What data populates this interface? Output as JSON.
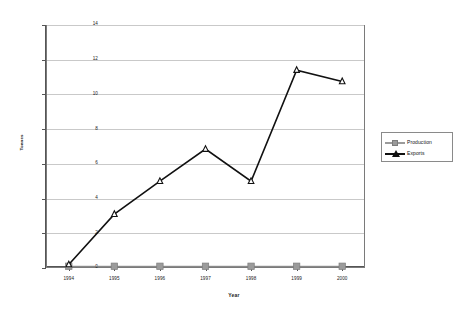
{
  "chart_data": {
    "type": "line",
    "title": "",
    "xlabel": "Year",
    "ylabel": "Tonnes",
    "categories": [
      "1994",
      "1995",
      "1996",
      "1997",
      "1998",
      "1999",
      "2000"
    ],
    "series": [
      {
        "name": "Production",
        "color": "#9b9b9b",
        "marker": "square",
        "values": [
          0.1,
          0.1,
          0.1,
          0.1,
          0.1,
          0.1,
          0.1
        ]
      },
      {
        "name": "Exports",
        "color": "#111111",
        "marker": "triangle",
        "values": [
          0.2,
          3.1,
          5.0,
          6.85,
          5.0,
          11.4,
          10.75
        ]
      }
    ],
    "ylim": [
      0,
      14
    ],
    "yticks": [
      "0",
      "2",
      "4",
      "6",
      "8",
      "10",
      "12",
      "14"
    ],
    "ytick_values": [
      0,
      2,
      4,
      6,
      8,
      10,
      12,
      14
    ],
    "grid": true,
    "legend_position": "right",
    "gridline_color": "#c9c9c9",
    "frame_color": "#7a7a7a",
    "background": "#ffffff"
  },
  "legend": {
    "entries": [
      {
        "label": "Production"
      },
      {
        "label": "Exports"
      }
    ]
  },
  "axes": {
    "x_title": "Year",
    "y_title": "Tonnes"
  }
}
